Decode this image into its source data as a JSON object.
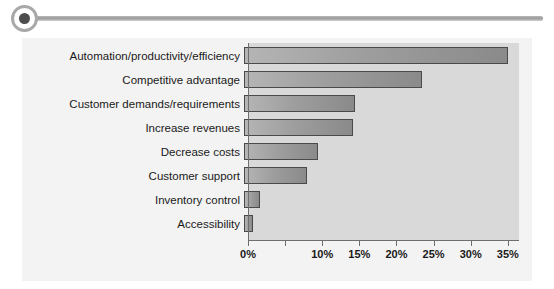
{
  "decoration": {
    "bullet_icon": "filled-circle-icon",
    "rule_icon": "horizontal-rule-icon"
  },
  "chart_data": {
    "type": "bar",
    "orientation": "horizontal",
    "title": "",
    "xlabel": "",
    "ylabel": "",
    "xlim": [
      0,
      36.5
    ],
    "grid": false,
    "legend": null,
    "tick_labels": [
      "0%",
      "10%",
      "15%",
      "20%",
      "25%",
      "30%",
      "35%"
    ],
    "tick_values": [
      0,
      10,
      15,
      20,
      25,
      30,
      35
    ],
    "tick_values_all": [
      0,
      5,
      10,
      15,
      20,
      25,
      30,
      35
    ],
    "categories": [
      "Automation/productivity/efficiency",
      "Competitive advantage",
      "Customer demands/requirements",
      "Increase revenues",
      "Decrease costs",
      "Customer support",
      "Inventory control",
      "Accessibility"
    ],
    "values": [
      35.5,
      24,
      15,
      14.7,
      10,
      8.5,
      2.2,
      1.2
    ],
    "colors": {
      "bar_fill_light": "#b5b5b5",
      "bar_fill_dark": "#8a8a8a",
      "bar_border": "#4a4a4a",
      "plot_background": "#d9d9d9",
      "chart_background": "#f3f3f3",
      "axis": "#6e6e6e",
      "text": "#1a1a1a"
    }
  }
}
